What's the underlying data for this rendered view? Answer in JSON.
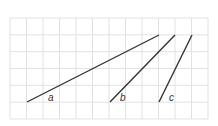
{
  "grid": {
    "x0": 10,
    "y0": 18,
    "cols": 12,
    "rows": 6,
    "cell_w": 16.5,
    "cell_h": 16.83,
    "line_color": "#e2e2e2"
  },
  "segments": [
    {
      "label": "a",
      "x1": 27,
      "y1": 102,
      "x2": 159,
      "y2": 35,
      "label_x": 48,
      "label_y": 101
    },
    {
      "label": "b",
      "x1": 110,
      "y1": 102,
      "x2": 175,
      "y2": 35,
      "label_x": 120,
      "label_y": 101
    },
    {
      "label": "c",
      "x1": 159,
      "y1": 102,
      "x2": 192,
      "y2": 35,
      "label_x": 169,
      "label_y": 101
    }
  ],
  "segment_color": "#333333"
}
